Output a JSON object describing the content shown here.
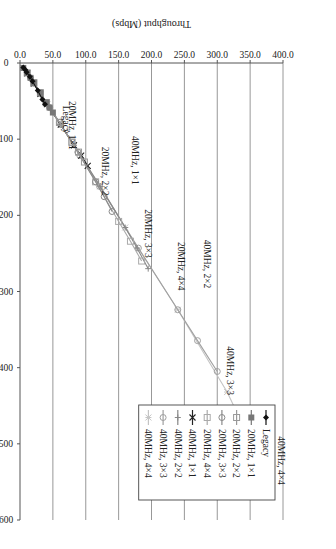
{
  "chart_data": {
    "type": "line",
    "orientation_note": "figure rotated 90 degrees clockwise on the page",
    "title": "",
    "xlabel": "PHY Rate (Mbps)",
    "ylabel": "Throughput (Mbps)",
    "xlim": [
      0,
      600
    ],
    "ylim": [
      0,
      400
    ],
    "xticks": [
      0,
      100,
      200,
      300,
      400,
      500,
      600
    ],
    "xtick_labels": [
      "0",
      "100",
      "200",
      "300",
      "400",
      "500",
      "600"
    ],
    "yticks": [
      0,
      50,
      100,
      150,
      200,
      250,
      300,
      350,
      400
    ],
    "ytick_labels": [
      "0.0",
      "50.0",
      "100.0",
      "150.0",
      "200.0",
      "250.0",
      "300.0",
      "350.0",
      "400.0"
    ],
    "grid": "horizontal",
    "legend_position": "top-left",
    "series": [
      {
        "name": "Legacy",
        "color": "#111111",
        "marker": "filled-diamond",
        "x": [
          6,
          9,
          12,
          18,
          24,
          36,
          48,
          54
        ],
        "y": [
          5,
          8,
          10,
          15,
          19,
          27,
          34,
          38
        ]
      },
      {
        "name": "20MHz, 1×1",
        "color": "#777777",
        "marker": "filled-square",
        "x": [
          6.5,
          13,
          19.5,
          26,
          39,
          52,
          58.5,
          65
        ],
        "y": [
          5,
          11,
          16,
          21,
          31,
          40,
          45,
          50
        ]
      },
      {
        "name": "20MHz, 2×2",
        "color": "#999999",
        "marker": "open-square",
        "x": [
          13,
          26,
          39,
          52,
          78,
          104,
          117,
          130
        ],
        "y": [
          11,
          21,
          31,
          40,
          60,
          79,
          89,
          98
        ]
      },
      {
        "name": "20MHz, 3×3",
        "color": "#8a8a8a",
        "marker": "open-circle",
        "x": [
          19.5,
          39,
          58.5,
          78,
          117,
          156,
          175.5,
          195
        ],
        "y": [
          16,
          31,
          45,
          60,
          88,
          115,
          128,
          140
        ]
      },
      {
        "name": "20MHz, 4×4",
        "color": "#aaaaaa",
        "marker": "open-square",
        "x": [
          26,
          52,
          78,
          104,
          156,
          208,
          234,
          260
        ],
        "y": [
          21,
          40,
          60,
          79,
          115,
          150,
          168,
          185
        ]
      },
      {
        "name": "40MHz, 1×1",
        "color": "#222222",
        "marker": "x",
        "x": [
          13.5,
          27,
          40.5,
          54,
          81,
          108,
          121.5,
          135
        ],
        "y": [
          11,
          21,
          31,
          41,
          62,
          82,
          93,
          103
        ]
      },
      {
        "name": "40MHz, 2×2",
        "color": "#888888",
        "marker": "plus",
        "x": [
          27,
          54,
          81,
          108,
          162,
          216,
          243,
          270
        ],
        "y": [
          21,
          41,
          62,
          82,
          122,
          160,
          178,
          195
        ]
      },
      {
        "name": "40MHz, 3×3",
        "color": "#a0a0a0",
        "marker": "open-circle",
        "x": [
          40.5,
          81,
          121.5,
          162,
          243,
          324,
          364.5,
          405
        ],
        "y": [
          31,
          62,
          91,
          121,
          180,
          240,
          270,
          300
        ]
      },
      {
        "name": "40MHz, 4×4",
        "color": "#c4c4c4",
        "marker": "asterisk",
        "x": [
          54,
          108,
          162,
          216,
          324,
          432,
          486,
          540
        ],
        "y": [
          41,
          82,
          122,
          160,
          240,
          315,
          345,
          378
        ]
      }
    ],
    "annotations": [
      {
        "text": "40MHz, 4×4",
        "x": 490,
        "y": 392
      },
      {
        "text": "40MHz, 3×3",
        "x": 372,
        "y": 315
      },
      {
        "text": "20MHz, 4×4",
        "x": 235,
        "y": 240
      },
      {
        "text": "40MHz, 2×2",
        "x": 232,
        "y": 280
      },
      {
        "text": "20MHz, 3×3",
        "x": 192,
        "y": 190
      },
      {
        "text": "20MHz, 2×2",
        "x": 110,
        "y": 125
      },
      {
        "text": "40MHz, 1×1",
        "x": 96,
        "y": 170
      },
      {
        "text": "20MHz, 1×1",
        "x": 50,
        "y": 75
      },
      {
        "text": "Legacy",
        "x": 56,
        "y": 66
      }
    ]
  }
}
